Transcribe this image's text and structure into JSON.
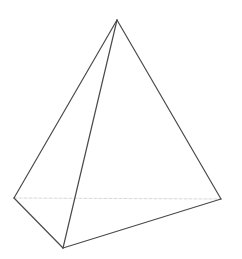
{
  "diagram": {
    "title": "",
    "shape": "tetrahedron",
    "colors": {
      "background": "#ffffff",
      "visible_edge": "#4a4a4a",
      "hidden_edge": "#d8d8d8"
    },
    "vertices": {
      "apex": [
        117,
        20
      ],
      "left": [
        14,
        198
      ],
      "bottom": [
        63,
        248
      ],
      "right": [
        221,
        199
      ]
    },
    "edges": [
      {
        "from": "apex",
        "to": "left",
        "hidden": false
      },
      {
        "from": "apex",
        "to": "bottom",
        "hidden": false
      },
      {
        "from": "apex",
        "to": "right",
        "hidden": false
      },
      {
        "from": "left",
        "to": "bottom",
        "hidden": false
      },
      {
        "from": "bottom",
        "to": "right",
        "hidden": false
      },
      {
        "from": "left",
        "to": "right",
        "hidden": true
      }
    ]
  }
}
